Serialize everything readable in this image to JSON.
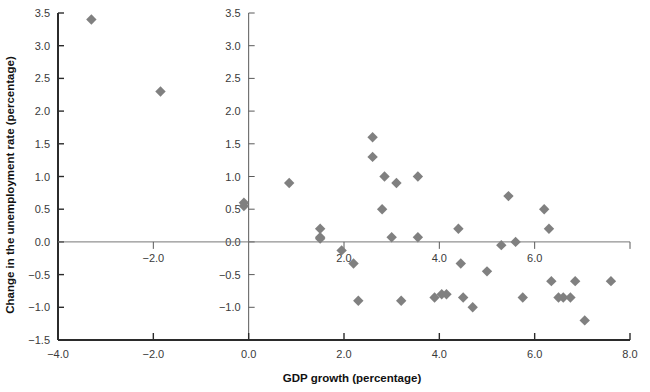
{
  "figure": {
    "kind": "scatter-plot",
    "background_color": "#ffffff",
    "marker_color": "#808080",
    "marker_shape": "diamond",
    "axis_color": "#2b2b2b"
  },
  "chart_data": {
    "type": "scatter",
    "title": "",
    "xlabel": "GDP growth (percentage)",
    "ylabel": "Change in the unemployment rate (percentage)",
    "xlim": [
      -4.0,
      8.0
    ],
    "ylim": [
      -1.5,
      3.5
    ],
    "grid": false,
    "legend": null,
    "xticks": [
      -4.0,
      -2.0,
      0.0,
      2.0,
      4.0,
      6.0,
      8.0
    ],
    "xticklabels": [
      "-4.0",
      "-2.0",
      "0.0",
      "2.0",
      "4.0",
      "6.0",
      "8.0"
    ],
    "yticks": [
      -1.5,
      -1.0,
      -0.5,
      0.0,
      0.5,
      1.0,
      1.5,
      2.0,
      2.5,
      3.0,
      3.5
    ],
    "yticklabels": [
      "-1.5",
      "-1.0",
      "-0.5",
      "0.0",
      "0.5",
      "1.0",
      "1.5",
      "2.0",
      "2.5",
      "3.0",
      "3.5"
    ],
    "secondary_axis": {
      "at_x": 0.0,
      "description": "duplicate y-axis drawn at x = 0.0",
      "ticks": [
        -1.0,
        -0.5,
        0.0,
        0.5,
        1.0,
        1.5,
        2.0,
        2.5,
        3.0,
        3.5
      ],
      "ticklabels": [
        "-1.0",
        "-0.5",
        "0.0",
        "0.5",
        "1.0",
        "1.5",
        "2.0",
        "2.5",
        "3.0",
        "3.5"
      ]
    },
    "points": [
      {
        "x": -3.3,
        "y": 3.4
      },
      {
        "x": -1.85,
        "y": 2.3
      },
      {
        "x": -0.1,
        "y": 0.6
      },
      {
        "x": -0.1,
        "y": 0.55
      },
      {
        "x": 0.85,
        "y": 0.9
      },
      {
        "x": 1.5,
        "y": 0.2
      },
      {
        "x": 1.5,
        "y": 0.07
      },
      {
        "x": 1.5,
        "y": 0.05
      },
      {
        "x": 1.95,
        "y": -0.13
      },
      {
        "x": 2.2,
        "y": -0.33
      },
      {
        "x": 2.3,
        "y": -0.9
      },
      {
        "x": 2.6,
        "y": 1.6
      },
      {
        "x": 2.6,
        "y": 1.3
      },
      {
        "x": 2.85,
        "y": 1.0
      },
      {
        "x": 2.8,
        "y": 0.5
      },
      {
        "x": 3.0,
        "y": 0.07
      },
      {
        "x": 3.1,
        "y": 0.9
      },
      {
        "x": 3.2,
        "y": -0.9
      },
      {
        "x": 3.55,
        "y": 1.0
      },
      {
        "x": 3.55,
        "y": 0.07
      },
      {
        "x": 3.9,
        "y": -0.85
      },
      {
        "x": 4.05,
        "y": -0.8
      },
      {
        "x": 4.15,
        "y": -0.8
      },
      {
        "x": 4.4,
        "y": 0.2
      },
      {
        "x": 4.45,
        "y": -0.33
      },
      {
        "x": 4.5,
        "y": -0.85
      },
      {
        "x": 4.7,
        "y": -1.0
      },
      {
        "x": 5.0,
        "y": -0.45
      },
      {
        "x": 5.3,
        "y": -0.05
      },
      {
        "x": 5.45,
        "y": 0.7
      },
      {
        "x": 5.6,
        "y": 0.0
      },
      {
        "x": 5.75,
        "y": -0.85
      },
      {
        "x": 6.2,
        "y": 0.5
      },
      {
        "x": 6.3,
        "y": 0.2
      },
      {
        "x": 6.35,
        "y": -0.6
      },
      {
        "x": 6.5,
        "y": -0.85
      },
      {
        "x": 6.6,
        "y": -0.85
      },
      {
        "x": 6.75,
        "y": -0.85
      },
      {
        "x": 6.85,
        "y": -0.6
      },
      {
        "x": 7.05,
        "y": -1.2
      },
      {
        "x": 7.6,
        "y": -0.6
      }
    ]
  }
}
